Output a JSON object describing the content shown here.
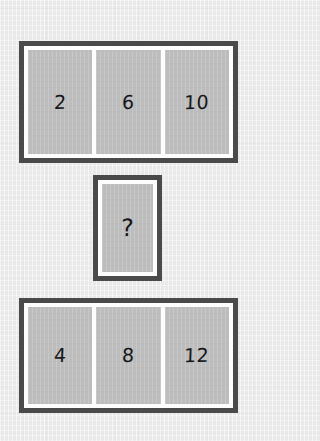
{
  "puzzle": {
    "type": "number-sequence-matrix",
    "background_color": "#e9e9e9",
    "border_color": "#4a4a4a",
    "inner_color": "#fdfdfd",
    "cell_color": "#bdbdbd",
    "text_color": "#16181a",
    "rows": [
      {
        "id": "top-row",
        "name": "top-row",
        "cells": [
          {
            "value": "2"
          },
          {
            "value": "6"
          },
          {
            "value": "10"
          }
        ]
      },
      {
        "id": "middle-row",
        "name": "middle-row",
        "cells": [
          {
            "value": "?"
          }
        ]
      },
      {
        "id": "bottom-row",
        "name": "bottom-row",
        "cells": [
          {
            "value": "4"
          },
          {
            "value": "8"
          },
          {
            "value": "12"
          }
        ]
      }
    ]
  }
}
